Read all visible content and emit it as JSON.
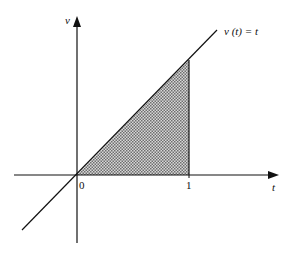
{
  "diagram": {
    "type": "function-plot",
    "axes": {
      "horizontal_label": "t",
      "vertical_label": "v"
    },
    "function_label": "v (t) = t",
    "function_label_parts": {
      "v": "v",
      "t_arg": "t",
      "rhs": "t"
    },
    "ticks": [
      {
        "label": "0",
        "value": 0
      },
      {
        "label": "1",
        "value": 1
      }
    ],
    "shaded_region": {
      "description": "area under v(t)=t from t=0 to t=1",
      "from": 0,
      "to": 1,
      "fill_pattern": "dotted gray"
    },
    "colors": {
      "line": "#111111",
      "shade": "#9a9a9a",
      "background": "#ffffff"
    }
  }
}
